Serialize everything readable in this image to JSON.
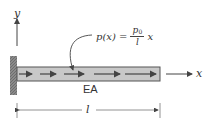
{
  "diagram": {
    "labels": {
      "y_axis": "y",
      "x_axis": "x",
      "stiffness": "EA",
      "length": "l"
    },
    "formula": {
      "lhs": "p(x) =",
      "numerator": "p",
      "numerator_sub": "0",
      "denominator": "l",
      "tail": "x"
    },
    "colors": {
      "wall": "#7a7a7a",
      "bar_fill": "#c8c8c8",
      "bar_border": "#555555",
      "arrows": "#444444",
      "lines": "#555555"
    }
  }
}
